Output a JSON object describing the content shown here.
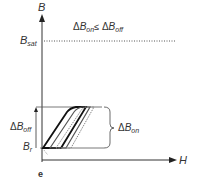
{
  "diagram": {
    "axis_y_label": "B",
    "axis_x_label": "H",
    "b_sat": {
      "main": "B",
      "sub": "sat"
    },
    "b_r": {
      "main": "B",
      "sub": "r"
    },
    "delta_b_off": {
      "prefix": "Δ",
      "main": "B",
      "sub": "off"
    },
    "delta_b_on": {
      "prefix": "Δ",
      "main": "B",
      "sub": "on"
    },
    "inequality": {
      "left_prefix": "Δ",
      "left_main": "B",
      "left_sub": "on",
      "op": "≤",
      "right_prefix": "Δ",
      "right_main": "B",
      "right_sub": "off"
    },
    "panel_label": "e",
    "colors": {
      "stroke": "#333333",
      "loop_dark": "#111111",
      "loop_mid": "#555555",
      "loop_light": "#888888"
    }
  }
}
